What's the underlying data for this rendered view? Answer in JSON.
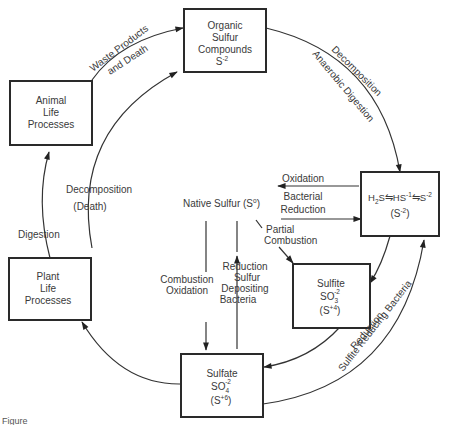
{
  "diagram": {
    "nodes": {
      "organic": {
        "lines": [
          "Organic",
          "Sulfur",
          "Compounds"
        ],
        "formula": "S",
        "formula_sup": "-2"
      },
      "animal": {
        "lines": [
          "Animal",
          "Life",
          "Processes"
        ]
      },
      "plant": {
        "lines": [
          "Plant",
          "Life",
          "Processes"
        ]
      },
      "sulfide": {
        "formula_parts": [
          "H",
          "2",
          "S",
          "⇋",
          "HS",
          "-1",
          "⇋",
          "S",
          "-2"
        ],
        "state": "(S",
        "state_sup": "-2",
        "state_close": ")"
      },
      "native": {
        "label": "Native Sulfur (S",
        "sup": "o",
        "close": ")"
      },
      "sulfite": {
        "name": "Sulfite",
        "formula": "SO",
        "sub": "3",
        "sup": "-2",
        "state": "(S",
        "state_sup": "+4",
        "state_close": ")"
      },
      "sulfate": {
        "name": "Sulfate",
        "formula": "SO",
        "sub": "4",
        "sup": "-2",
        "state": "(S",
        "state_sup": "+6",
        "state_close": ")"
      }
    },
    "edges": {
      "waste": [
        "Waste Products",
        "and Death"
      ],
      "decomposition_outer": [
        "Decomposition",
        "Anaerobic Digestion"
      ],
      "oxidation": "Oxidation",
      "bacterial_reduction": [
        "Bacterial",
        "Reduction"
      ],
      "partial_combustion": [
        "Partial",
        "Combustion"
      ],
      "combustion_oxidation": [
        "Combustion",
        "Oxidation"
      ],
      "reduction_sulfur": [
        "Reduction",
        "Sulfur",
        "Depositing",
        "Bacteria"
      ],
      "reduction_bacteria": [
        "Reduction",
        "Sulfite Reducing Bacteria"
      ],
      "decomposition_death": [
        "Decomposition",
        "(Death)"
      ],
      "digestion": "Digestion"
    },
    "caption": "Figure"
  }
}
